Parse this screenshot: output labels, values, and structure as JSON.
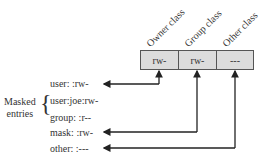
{
  "classes": [
    {
      "label": "Owner class",
      "permission": "rw-"
    },
    {
      "label": "Group class",
      "permission": "rw-"
    },
    {
      "label": "Other class",
      "permission": "---"
    }
  ],
  "entries": [
    {
      "text": "user: :rw-"
    },
    {
      "text": "user:joe:rw-"
    },
    {
      "text": "group: :r--"
    },
    {
      "text": "mask: :rw-"
    },
    {
      "text": "other: :---"
    }
  ],
  "masked_label": {
    "line1": "Masked",
    "line2": "entries"
  },
  "brace": "{",
  "colors": {
    "box_fill": "#dcdcdc",
    "line": "#222222"
  }
}
